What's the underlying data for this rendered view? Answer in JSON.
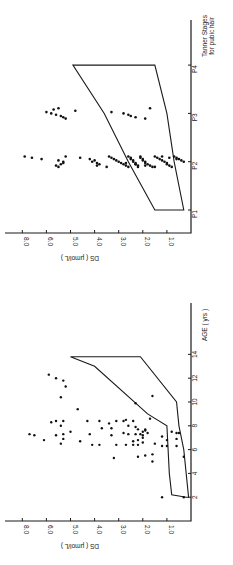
{
  "chart_data": [
    {
      "type": "scatter",
      "title": "",
      "xlabel": "Tanner Stages for public hair",
      "ylabel": "DS (μmol/L)",
      "orientation": "rotated-90-ccw",
      "categories": [
        "P1",
        "P2",
        "P3",
        "P4"
      ],
      "y_tick_labels": [
        "8.0",
        "6.0",
        "5.0",
        "4.0",
        "3.0",
        "2.0",
        "1.0"
      ],
      "y_tick_positions": [
        7,
        6,
        5,
        4,
        3,
        2,
        1
      ],
      "ylim": [
        0,
        7.2
      ],
      "envelope": {
        "upper": [
          [
            1,
            1.5
          ],
          [
            2,
            2.6
          ],
          [
            3,
            3.6
          ],
          [
            4,
            4.9
          ]
        ],
        "lower": [
          [
            1,
            0.3
          ],
          [
            2,
            0.7
          ],
          [
            3,
            1.0
          ],
          [
            4,
            1.5
          ]
        ]
      },
      "points": [
        [
          2,
          6.9
        ],
        [
          2,
          6.6
        ],
        [
          2,
          6.2
        ],
        [
          2,
          5.5
        ],
        [
          2,
          5.3
        ],
        [
          2,
          5.3
        ],
        [
          2,
          5.4
        ],
        [
          2,
          5.6
        ],
        [
          2,
          5.5
        ],
        [
          2,
          5.2
        ],
        [
          2,
          4.6
        ],
        [
          2,
          4.2
        ],
        [
          2,
          4.0
        ],
        [
          2,
          4.1
        ],
        [
          2,
          3.9
        ],
        [
          2,
          3.8
        ],
        [
          2,
          3.9
        ],
        [
          2,
          3.5
        ],
        [
          2,
          3.4
        ],
        [
          2,
          3.3
        ],
        [
          2,
          3.2
        ],
        [
          2,
          3.1
        ],
        [
          2,
          3.0
        ],
        [
          2,
          2.9
        ],
        [
          2,
          2.8
        ],
        [
          2,
          2.7
        ],
        [
          2,
          2.6
        ],
        [
          2,
          2.6
        ],
        [
          2,
          2.5
        ],
        [
          2,
          2.5
        ],
        [
          2,
          2.4
        ],
        [
          2,
          2.4
        ],
        [
          2,
          2.3
        ],
        [
          2,
          2.3
        ],
        [
          2,
          2.2
        ],
        [
          2,
          2.2
        ],
        [
          2,
          2.1
        ],
        [
          2,
          2.1
        ],
        [
          2,
          2.0
        ],
        [
          2,
          2.0
        ],
        [
          2,
          1.9
        ],
        [
          2,
          1.9
        ],
        [
          2,
          1.8
        ],
        [
          2,
          1.7
        ],
        [
          2,
          1.6
        ],
        [
          2,
          1.5
        ],
        [
          2,
          1.4
        ],
        [
          2,
          1.3
        ],
        [
          2,
          1.2
        ],
        [
          2,
          1.1
        ],
        [
          2,
          1.0
        ],
        [
          2,
          1.0
        ],
        [
          2,
          0.9
        ],
        [
          2,
          0.8
        ],
        [
          2,
          0.7
        ],
        [
          2,
          0.6
        ],
        [
          2,
          0.5
        ],
        [
          2,
          0.4
        ],
        [
          2,
          0.3
        ],
        [
          2,
          2.7
        ],
        [
          2,
          2.3
        ],
        [
          2,
          1.9
        ],
        [
          2,
          1.5
        ],
        [
          2,
          1.2
        ],
        [
          2,
          0.9
        ],
        [
          2,
          0.6
        ],
        [
          3,
          6.0
        ],
        [
          3,
          5.8
        ],
        [
          3,
          5.6
        ],
        [
          3,
          5.4
        ],
        [
          3,
          5.3
        ],
        [
          3,
          5.2
        ],
        [
          3,
          5.5
        ],
        [
          3,
          5.7
        ],
        [
          3,
          4.8
        ],
        [
          3,
          3.3
        ],
        [
          3,
          2.8
        ],
        [
          3,
          2.6
        ],
        [
          3,
          2.5
        ],
        [
          3,
          2.3
        ],
        [
          3,
          1.9
        ],
        [
          3,
          1.7
        ]
      ]
    },
    {
      "type": "scatter",
      "title": "",
      "xlabel": "AGE (yrs)",
      "ylabel": "DS (μmol/L)",
      "orientation": "rotated-90-ccw",
      "x_ticks": [
        2,
        4,
        6,
        8,
        10,
        12,
        14
      ],
      "xlim": [
        0,
        18
      ],
      "y_tick_labels": [
        "8.0",
        "6.0",
        "5.0",
        "4.0",
        "3.0",
        "2.0",
        "1.0"
      ],
      "y_tick_positions": [
        7,
        6,
        5,
        4,
        3,
        2,
        1
      ],
      "ylim": [
        0,
        7.2
      ],
      "envelope": {
        "upper": [
          [
            2,
            0.2
          ],
          [
            2.1,
            0.5
          ],
          [
            2.2,
            0.8
          ],
          [
            4,
            0.9
          ],
          [
            8,
            1.0
          ],
          [
            9,
            1.8
          ],
          [
            13,
            4.0
          ],
          [
            13.8,
            5.0
          ]
        ],
        "lower": [
          [
            2,
            0.1
          ],
          [
            6,
            0.3
          ],
          [
            8,
            0.5
          ],
          [
            10,
            0.6
          ],
          [
            13.8,
            2.1
          ]
        ]
      },
      "points": [
        [
          2,
          1.2
        ],
        [
          5,
          1.6
        ],
        [
          5.3,
          3.2
        ],
        [
          5.4,
          2.2
        ],
        [
          5.5,
          1.9
        ],
        [
          5.6,
          1.6
        ],
        [
          6.3,
          1.2
        ],
        [
          6.3,
          1.0
        ],
        [
          6.4,
          4.1
        ],
        [
          6.4,
          3.8
        ],
        [
          6.4,
          3.1
        ],
        [
          6.4,
          2.7
        ],
        [
          6.4,
          2.4
        ],
        [
          6.4,
          2.2
        ],
        [
          6.5,
          5.4
        ],
        [
          6.5,
          1.5
        ],
        [
          6.6,
          2.0
        ],
        [
          6.7,
          4.6
        ],
        [
          6.7,
          2.4
        ],
        [
          6.8,
          6.1
        ],
        [
          6.8,
          2.2
        ],
        [
          6.8,
          1.0
        ],
        [
          6.9,
          5.3
        ],
        [
          7.0,
          2.0
        ],
        [
          7.1,
          1.2
        ],
        [
          7.2,
          6.5
        ],
        [
          7.2,
          5.6
        ],
        [
          7.2,
          3.3
        ],
        [
          7.2,
          2.0
        ],
        [
          7.3,
          6.7
        ],
        [
          7.3,
          5.3
        ],
        [
          7.3,
          4.2
        ],
        [
          7.3,
          2.6
        ],
        [
          7.3,
          2.3
        ],
        [
          7.3,
          2.1
        ],
        [
          7.4,
          2.8
        ],
        [
          7.4,
          1.8
        ],
        [
          7.5,
          5.0
        ],
        [
          7.5,
          2.0
        ],
        [
          7.6,
          1.9
        ],
        [
          7.7,
          2.2
        ],
        [
          7.7,
          1.9
        ],
        [
          7.8,
          3.7
        ],
        [
          7.8,
          3.3
        ],
        [
          7.9,
          2.3
        ],
        [
          8.0,
          5.4
        ],
        [
          8.0,
          2.6
        ],
        [
          8.2,
          3.4
        ],
        [
          8.3,
          5.8
        ],
        [
          8.4,
          5.6
        ],
        [
          8.4,
          5.3
        ],
        [
          8.4,
          4.3
        ],
        [
          8.4,
          3.8
        ],
        [
          8.4,
          3.1
        ],
        [
          8.4,
          2.8
        ],
        [
          8.4,
          2.4
        ],
        [
          8.5,
          2.7
        ],
        [
          8.6,
          1.7
        ],
        [
          7.5,
          0.8
        ],
        [
          7.4,
          0.5
        ],
        [
          9.4,
          4.7
        ],
        [
          9.9,
          2.3
        ],
        [
          10.4,
          5.4
        ],
        [
          10.5,
          1.6
        ],
        [
          11.3,
          5.2
        ],
        [
          11.8,
          5.3
        ],
        [
          12.0,
          5.6
        ],
        [
          12.3,
          5.9
        ],
        [
          2,
          0.3
        ],
        [
          5.4,
          0.3
        ],
        [
          6.3,
          0.6
        ],
        [
          6.9,
          0.6
        ],
        [
          7.4,
          0.6
        ]
      ]
    }
  ],
  "figure": {
    "top_panel": {
      "axis_label_y": "DS ( μmol/L )",
      "axis_label_x_line1": "Tanner Stages",
      "axis_label_x_line2": "for pubic hair",
      "stage_labels": [
        "P1",
        "P2",
        "P3",
        "P4"
      ]
    },
    "bottom_panel": {
      "axis_label_y": "DS ( μmol/L )",
      "axis_label_x": "AGE ( yrs )",
      "age_labels": [
        "2",
        "4",
        "6",
        "8",
        "10",
        "12",
        "14"
      ]
    },
    "ds_tick_labels": [
      "8.0",
      "6.0",
      "5.0",
      "4.0",
      "3.0",
      "2.0",
      "1.0"
    ]
  }
}
